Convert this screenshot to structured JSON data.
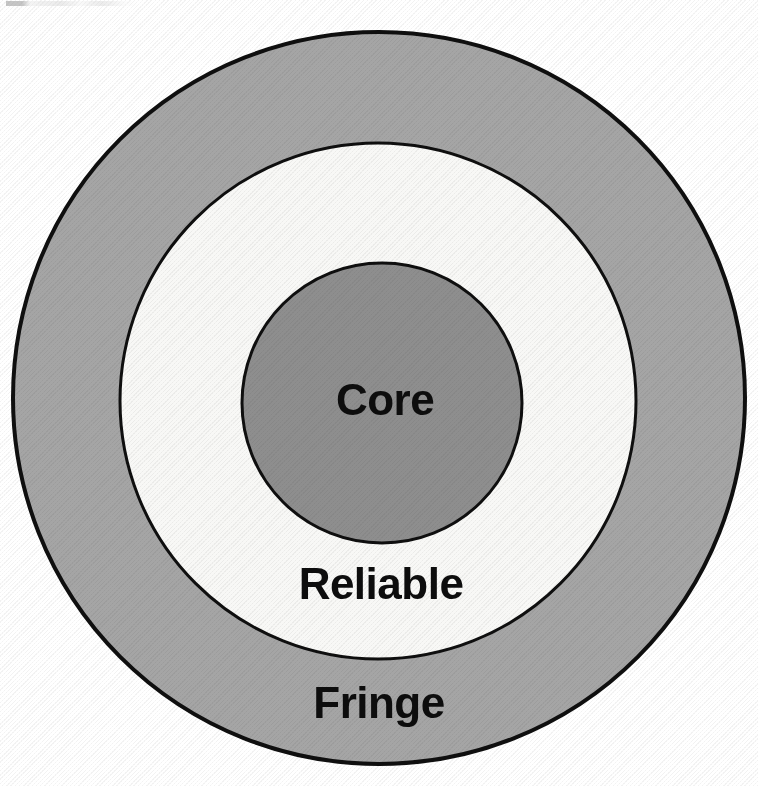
{
  "diagram": {
    "type": "concentric-circles",
    "canvas": {
      "width": 758,
      "height": 786,
      "background": "#ffffff"
    },
    "rings": [
      {
        "key": "fringe",
        "label": "Fringe",
        "level": 3,
        "position": "outer",
        "fill": "#a5a5a5",
        "stroke": "#0f0f0f",
        "stroke_width": 4,
        "center_x": 379,
        "center_y": 398,
        "radius": 366,
        "label_x": 379,
        "label_y": 706,
        "label_size": 44
      },
      {
        "key": "reliable",
        "label": "Reliable",
        "level": 2,
        "position": "middle",
        "fill": "#f8f8f6",
        "stroke": "#0f0f0f",
        "stroke_width": 3,
        "center_x": 378,
        "center_y": 401,
        "radius": 258,
        "label_x": 381,
        "label_y": 587,
        "label_size": 44
      },
      {
        "key": "core",
        "label": "Core",
        "level": 1,
        "position": "inner",
        "fill": "#8e8e8e",
        "stroke": "#0f0f0f",
        "stroke_width": 3,
        "center_x": 382,
        "center_y": 403,
        "radius": 140,
        "label_x": 385,
        "label_y": 403,
        "label_size": 44
      }
    ]
  }
}
